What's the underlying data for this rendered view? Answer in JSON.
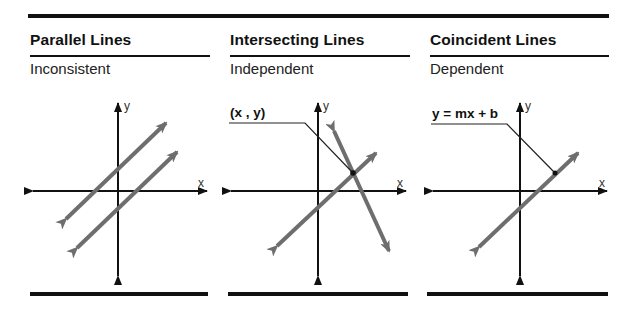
{
  "panels": [
    {
      "title": "Parallel Lines",
      "subtitle": "Inconsistent",
      "x_axis_label": "x",
      "y_axis_label": "y",
      "annotation": null
    },
    {
      "title": "Intersecting Lines",
      "subtitle": "Independent",
      "x_axis_label": "x",
      "y_axis_label": "y",
      "annotation": "(x , y)"
    },
    {
      "title": "Coincident Lines",
      "subtitle": "Dependent",
      "x_axis_label": "x",
      "y_axis_label": "y",
      "annotation": "y = mx + b"
    }
  ],
  "colors": {
    "rules": "#111111",
    "axes": "#111111",
    "lines": "#6e6e6e",
    "background": "#ffffff"
  }
}
